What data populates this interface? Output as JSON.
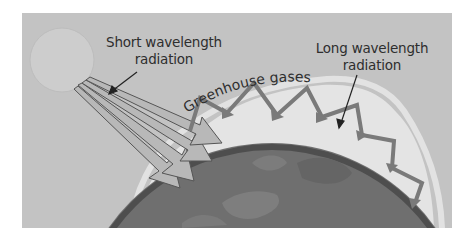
{
  "diagram": {
    "labels": {
      "short_wavelength": {
        "line1": "Short wavelength",
        "line2": "radiation"
      },
      "long_wavelength": {
        "line1": "Long wavelength",
        "line2": "radiation"
      },
      "greenhouse_gases": "Greenhouse gases"
    },
    "elements": {
      "sun": "sun",
      "earth": "earth-globe",
      "atmosphere": "greenhouse-gas-layer",
      "incoming_arrows": 4,
      "reflected_arrows": 6
    },
    "colors": {
      "background": "#c3c3c3",
      "atmosphere": "#e6e6e6",
      "earth": "#6f6f6f",
      "earth_rim": "#4a4a4a",
      "arrow_fill": "#b5b5b5",
      "arrow_stroke": "#5a5a5a",
      "text": "#2e2e2e"
    }
  }
}
